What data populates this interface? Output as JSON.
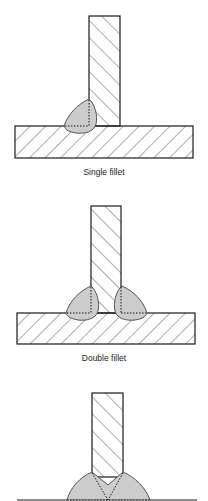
{
  "diagram": {
    "colors": {
      "outline": "#1a1a1a",
      "hatch": "#333333",
      "weld_fill": "#cccccc",
      "weld_outline": "#555555",
      "background": "#ffffff"
    },
    "figures": [
      {
        "id": "single-fillet",
        "label": "Single fillet",
        "weld_count": 1
      },
      {
        "id": "double-fillet",
        "label": "Double fillet",
        "weld_count": 2
      },
      {
        "id": "third-weld",
        "label": "",
        "weld_count": 1
      }
    ]
  }
}
